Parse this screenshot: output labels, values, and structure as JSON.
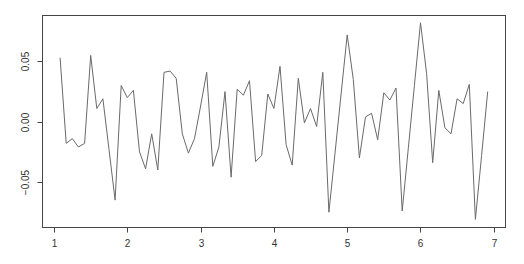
{
  "chart_data": {
    "type": "line",
    "title": "",
    "xlabel": "",
    "ylabel": "",
    "xlim": [
      0.836,
      7.153
    ],
    "ylim": [
      -0.0873,
      0.0885
    ],
    "grid": false,
    "legend": null,
    "x_ticks": [
      1,
      2,
      3,
      4,
      5,
      6,
      7
    ],
    "x_tick_labels": [
      "1",
      "2",
      "3",
      "4",
      "5",
      "6",
      "7"
    ],
    "y_ticks": [
      0.05,
      0.0,
      -0.05
    ],
    "y_tick_labels": [
      "0.05",
      "0.00",
      "-0.05"
    ],
    "x_start": 1.0833,
    "x_step": 0.08333,
    "series": [
      {
        "name": "series",
        "color": "#6a6a6a",
        "values": [
          0.053,
          -0.018,
          -0.014,
          -0.021,
          -0.018,
          0.055,
          0.011,
          0.019,
          -0.023,
          -0.065,
          0.03,
          0.02,
          0.026,
          -0.025,
          -0.039,
          -0.01,
          -0.04,
          0.041,
          0.042,
          0.036,
          -0.01,
          -0.026,
          -0.014,
          0.013,
          0.041,
          -0.037,
          -0.021,
          0.025,
          -0.046,
          0.027,
          0.022,
          0.034,
          -0.033,
          -0.028,
          0.023,
          0.011,
          0.046,
          -0.019,
          -0.036,
          0.036,
          -0.001,
          0.011,
          -0.004,
          0.041,
          -0.075,
          -0.026,
          0.023,
          0.072,
          0.035,
          -0.03,
          0.004,
          0.007,
          -0.015,
          0.024,
          0.018,
          0.028,
          -0.074,
          -0.022,
          0.03,
          0.082,
          0.04,
          -0.034,
          0.026,
          -0.005,
          -0.01,
          0.019,
          0.015,
          0.031,
          -0.081,
          -0.028,
          0.025
        ]
      }
    ]
  },
  "layout": {
    "plot_left": 42,
    "plot_right": 505,
    "plot_top": 15,
    "plot_bottom": 227,
    "axis_color": "#444444",
    "text_color": "#333333"
  }
}
